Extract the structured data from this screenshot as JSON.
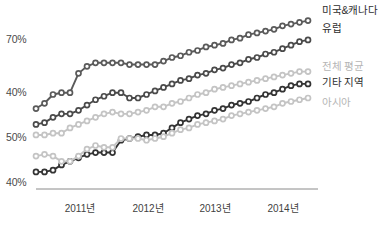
{
  "chart_data": {
    "type": "line",
    "title": "",
    "subtitle": "",
    "xlabel": "",
    "ylabel": "",
    "grid": false,
    "legend_position": "right-inline",
    "x_tick_labels": [
      "2011년",
      "2012년",
      "2013년",
      "2014년"
    ],
    "y_tick_labels": [
      "70%",
      "40%",
      "50%",
      "40%"
    ],
    "x": [
      0,
      1,
      2,
      3,
      4,
      5,
      6,
      7,
      8,
      9,
      10,
      11,
      12,
      13,
      14,
      15,
      16,
      17,
      18,
      19,
      20,
      21,
      22,
      23,
      24,
      25,
      26,
      27,
      28,
      29,
      30,
      31,
      32
    ],
    "series": [
      {
        "name": "미국&캐나다",
        "color": "#5a5a5a",
        "label": "미국&캐나다",
        "values": [
          44,
          47,
          52,
          53,
          53,
          64,
          68,
          70,
          70,
          70,
          70,
          69,
          69,
          69,
          69,
          71,
          73,
          74,
          76,
          77,
          79,
          80,
          81,
          83,
          84,
          86,
          87,
          88,
          89,
          91,
          92,
          93,
          94
        ]
      },
      {
        "name": "유럽",
        "color": "#4a4a4a",
        "label": "유럽",
        "values": [
          35,
          36,
          39,
          41,
          41,
          43,
          46,
          49,
          51,
          53,
          53,
          50,
          50,
          52,
          54,
          56,
          58,
          60,
          61,
          63,
          64,
          66,
          67,
          69,
          70,
          72,
          73,
          75,
          76,
          78,
          80,
          82,
          83
        ]
      },
      {
        "name": "전체 평균",
        "color": "#c4c4c4",
        "label": "전체 평균",
        "values": [
          29,
          29,
          30,
          30,
          33,
          35,
          37,
          39,
          41,
          42,
          41,
          41,
          42,
          43,
          45,
          45,
          47,
          48,
          50,
          52,
          53,
          55,
          56,
          57,
          58,
          59,
          60,
          61,
          62,
          63,
          64,
          65,
          65
        ]
      },
      {
        "name": "기타 지역",
        "color": "#333333",
        "label": "기타 지역",
        "values": [
          8,
          8,
          9,
          12,
          14,
          16,
          18,
          19,
          19,
          19,
          26,
          27,
          28,
          29,
          29,
          30,
          33,
          36,
          38,
          40,
          41,
          43,
          44,
          46,
          47,
          48,
          50,
          52,
          53,
          55,
          57,
          58,
          58
        ]
      },
      {
        "name": "아시아",
        "color": "#c4c4c4",
        "label": "아시아",
        "values": [
          17,
          18,
          17,
          14,
          14,
          17,
          21,
          23,
          22,
          22,
          27,
          27,
          27,
          26,
          27,
          28,
          30,
          32,
          33,
          35,
          36,
          37,
          38,
          40,
          41,
          42,
          43,
          44,
          45,
          47,
          48,
          49,
          50
        ]
      }
    ]
  },
  "axis": {
    "baseline_color": "#8a8a8a"
  }
}
